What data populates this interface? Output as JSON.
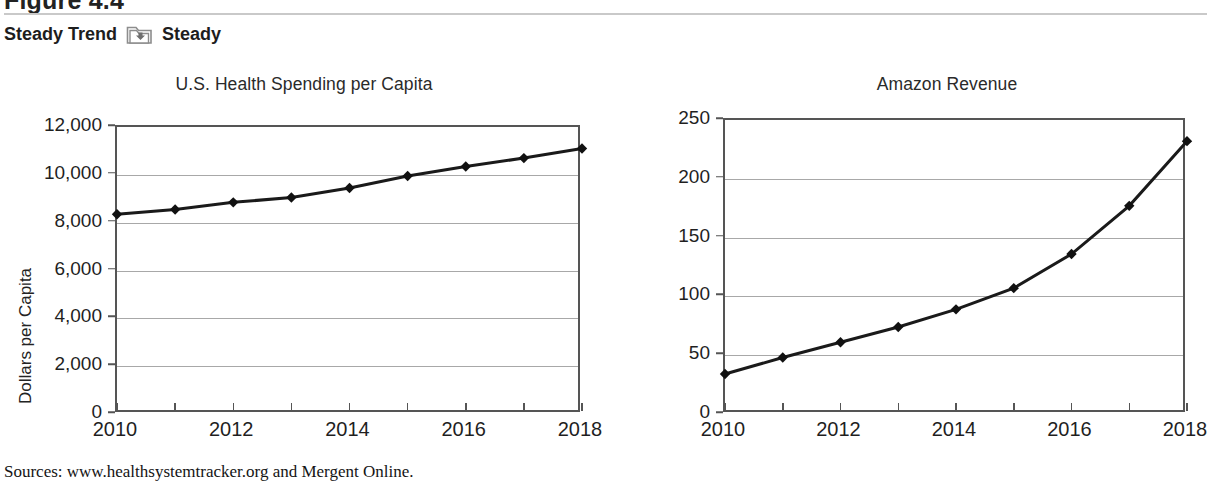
{
  "header": {
    "figure_label": "Figure 4.4",
    "trend_label": "Steady Trend",
    "trend_value": "Steady",
    "folder_icon": "folder-down-icon"
  },
  "sources": "Sources: www.healthsystemtracker.org and Mergent Online.",
  "colors": {
    "line": "#1a1a1a",
    "marker": "#111111",
    "axis": "#555555",
    "grid": "#a8a8a8",
    "rule": "#c9c9c9",
    "folder": "#8d8d8d"
  },
  "chart_data": [
    {
      "id": "health-spending",
      "type": "line",
      "title": "U.S. Health Spending per Capita",
      "xlabel": "",
      "ylabel": "Dollars per Capita",
      "x": [
        2010,
        2011,
        2012,
        2013,
        2014,
        2015,
        2016,
        2017,
        2018
      ],
      "values": [
        8350,
        8550,
        8850,
        9050,
        9450,
        9950,
        10350,
        10700,
        11100
      ],
      "ylim": [
        0,
        12000
      ],
      "yticks": [
        0,
        2000,
        4000,
        6000,
        8000,
        10000,
        12000
      ],
      "ytick_labels": [
        "0",
        "2,000",
        "4,000",
        "6,000",
        "8,000",
        "10,000",
        "12,000"
      ],
      "xlim": [
        2010,
        2018
      ],
      "xticks": [
        2010,
        2011,
        2012,
        2013,
        2014,
        2015,
        2016,
        2017,
        2018
      ],
      "xtick_labels": [
        "2010",
        "",
        "2012",
        "",
        "2014",
        "",
        "2016",
        "",
        "2018"
      ],
      "grid": true,
      "legend": "none",
      "marker": "diamond"
    },
    {
      "id": "amazon-revenue",
      "type": "line",
      "title": "Amazon Revenue",
      "xlabel": "",
      "ylabel": "Billions of Dollars",
      "x": [
        2010,
        2011,
        2012,
        2013,
        2014,
        2015,
        2016,
        2017,
        2018
      ],
      "values": [
        34,
        48,
        61,
        74,
        89,
        107,
        136,
        177,
        232
      ],
      "ylim": [
        0,
        250
      ],
      "yticks": [
        0,
        50,
        100,
        150,
        200,
        250
      ],
      "ytick_labels": [
        "0",
        "50",
        "100",
        "150",
        "200",
        "250"
      ],
      "xlim": [
        2010,
        2018
      ],
      "xticks": [
        2010,
        2011,
        2012,
        2013,
        2014,
        2015,
        2016,
        2017,
        2018
      ],
      "xtick_labels": [
        "2010",
        "",
        "2012",
        "",
        "2014",
        "",
        "2016",
        "",
        "2018"
      ],
      "grid": true,
      "legend": "none",
      "marker": "diamond"
    }
  ]
}
